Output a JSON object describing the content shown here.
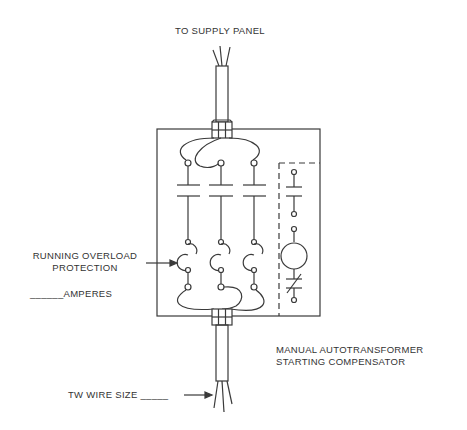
{
  "labels": {
    "supply_panel": "TO SUPPLY PANEL",
    "overload_line1": "RUNNING OVERLOAD",
    "overload_line2": "PROTECTION",
    "amperes_blank": "______",
    "amperes": "AMPERES",
    "compensator_line1": "MANUAL AUTOTRANSFORMER",
    "compensator_line2": "STARTING COMPENSATOR",
    "wire_size": "TW WIRE SIZE",
    "wire_size_blank": "_____"
  },
  "colors": {
    "line": "#3a3a3a",
    "text": "#333333",
    "background": "#ffffff"
  },
  "diagram": {
    "phases": 3,
    "components": [
      "supply-cable",
      "terminal-block-top",
      "line-contacts",
      "overload-heaters",
      "terminal-block-bottom",
      "load-cable",
      "control-circuit"
    ]
  }
}
